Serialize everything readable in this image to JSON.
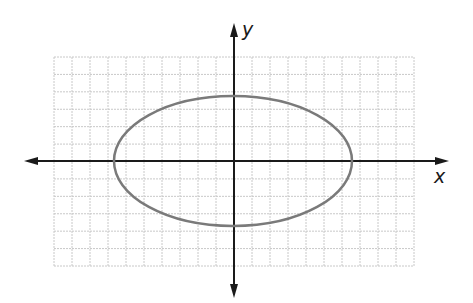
{
  "diagram": {
    "type": "conic-section",
    "shape": "ellipse",
    "colors": {
      "background": "#ffffff",
      "grid": "#c8c8c8",
      "axes": "#1a1a1a",
      "curve": "#7a7a7a"
    },
    "axes": {
      "x_label": "x",
      "y_label": "y",
      "arrows": "both-ends"
    },
    "grid": {
      "columns": 20,
      "rows": 12,
      "origin_col": 10,
      "origin_row": 6
    },
    "ellipse": {
      "center": [
        0,
        0
      ],
      "semi_axis_x_approx": 6.6,
      "semi_axis_y_approx": 3.7,
      "note": "approximate, measured from pixels; no tick labels shown"
    }
  },
  "chart_data": {
    "type": "line",
    "title": "",
    "xlabel": "x",
    "ylabel": "y",
    "grid": true,
    "series": [
      {
        "name": "ellipse",
        "shape": "ellipse",
        "center": [
          0,
          0
        ],
        "rx_approx": 6.6,
        "ry_approx": 3.7
      }
    ]
  }
}
